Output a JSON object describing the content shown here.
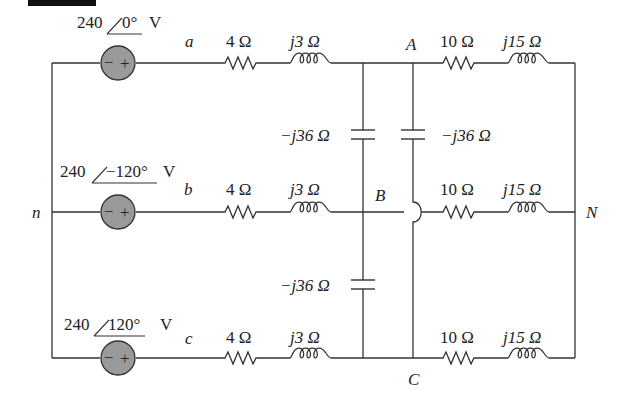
{
  "diagram": {
    "sources": [
      {
        "phase": "a",
        "label": "240",
        "angle": "0°",
        "unit": "V",
        "node": "a"
      },
      {
        "phase": "b",
        "label": "240",
        "angle": "−120°",
        "unit": "V",
        "node": "b"
      },
      {
        "phase": "c",
        "label": "240",
        "angle": "120°",
        "unit": "V",
        "node": "c"
      }
    ],
    "source_polarity": {
      "minus": "−",
      "plus": "+"
    },
    "line_impedances": [
      {
        "R": "4 Ω",
        "X": "j3 Ω"
      },
      {
        "R": "4 Ω",
        "X": "j3 Ω"
      },
      {
        "R": "4 Ω",
        "X": "j3 Ω"
      }
    ],
    "capacitors": [
      {
        "between": "A-B",
        "label": "−j36 Ω",
        "side": "left"
      },
      {
        "between": "A-C",
        "label": "−j36 Ω",
        "side": "right"
      },
      {
        "between": "B-C",
        "label": "−j36 Ω",
        "side": "left"
      }
    ],
    "load_impedances": [
      {
        "R": "10 Ω",
        "X": "j15 Ω"
      },
      {
        "R": "10 Ω",
        "X": "j15 Ω"
      },
      {
        "R": "10 Ω",
        "X": "j15 Ω"
      }
    ],
    "nodes": {
      "n": "n",
      "N": "N",
      "A": "A",
      "B": "B",
      "C": "C",
      "a": "a",
      "b": "b",
      "c": "c"
    },
    "colors": {
      "source_fill": "#9a9a9a",
      "wire": "#333333",
      "background": "#ffffff"
    }
  }
}
